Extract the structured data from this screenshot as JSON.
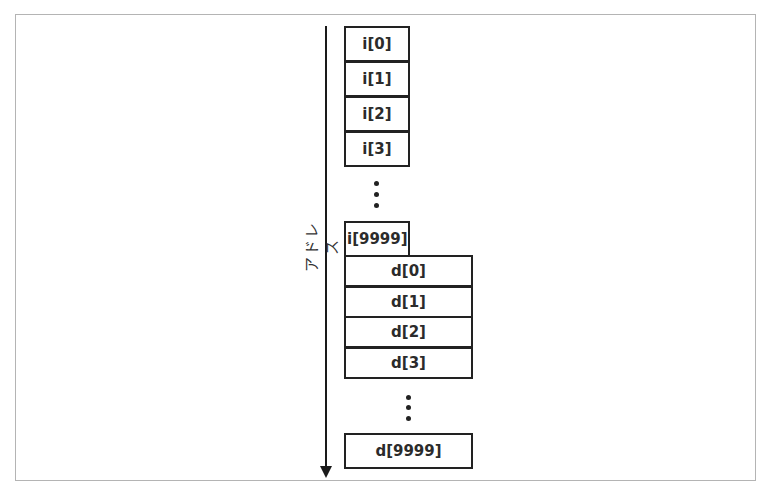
{
  "diagram": {
    "axis": {
      "label": "アドレス",
      "direction": "down"
    },
    "int_array": {
      "cells": [
        "i[0]",
        "i[1]",
        "i[2]",
        "i[3]"
      ],
      "ellipsis": "⋮",
      "last": "i[9999]"
    },
    "double_array": {
      "cells": [
        "d[0]",
        "d[1]",
        "d[2]",
        "d[3]"
      ],
      "ellipsis": "⋮",
      "last": "d[9999]"
    },
    "colors": {
      "stroke": "#222222",
      "frame": "#b4b4b4",
      "background": "#ffffff"
    }
  }
}
